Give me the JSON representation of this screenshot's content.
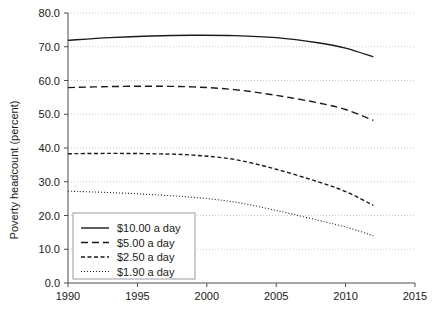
{
  "chart_data": {
    "type": "line",
    "title": "",
    "xlabel": "",
    "ylabel": "Poverty headcount (percent)",
    "xlim": [
      1990,
      2015
    ],
    "ylim": [
      0.0,
      80.0
    ],
    "grid": true,
    "legend_position": "lower-left",
    "x_ticks": [
      "1990",
      "1995",
      "2000",
      "2005",
      "2010",
      "2015"
    ],
    "y_ticks": [
      "0.0",
      "10.0",
      "20.0",
      "30.0",
      "40.0",
      "50.0",
      "60.0",
      "70.0",
      "80.0"
    ],
    "x": [
      1990,
      1993,
      1996,
      1999,
      2002,
      2005,
      2008,
      2010,
      2012
    ],
    "series": [
      {
        "name": "$10.00 a day",
        "style": "solid",
        "values": [
          71.9,
          72.7,
          73.2,
          73.4,
          73.3,
          72.7,
          71.2,
          69.6,
          67.0
        ]
      },
      {
        "name": "$5.00 a day",
        "style": "dashed-long",
        "values": [
          57.9,
          58.2,
          58.3,
          58.1,
          57.3,
          55.6,
          53.4,
          51.4,
          48.2
        ]
      },
      {
        "name": "$2.50 a day",
        "style": "dashed-short",
        "values": [
          38.3,
          38.4,
          38.3,
          37.9,
          36.6,
          33.7,
          30.0,
          27.1,
          23.0
        ]
      },
      {
        "name": "$1.90 a day",
        "style": "dotted",
        "values": [
          27.2,
          26.8,
          26.2,
          25.4,
          24.0,
          21.5,
          18.6,
          16.6,
          14.0
        ]
      }
    ]
  },
  "axes": {
    "y_axis_title": "Poverty headcount (percent)"
  },
  "legend": {
    "items": [
      {
        "label": "$10.00 a day",
        "style": "solid"
      },
      {
        "label": "$5.00 a day",
        "style": "dashed-long"
      },
      {
        "label": "$2.50 a day",
        "style": "dashed-short"
      },
      {
        "label": "$1.90 a day",
        "style": "dotted"
      }
    ]
  },
  "colors": {
    "ink": "#1a1a1a",
    "axis": "#4d4d4d",
    "grid": "#c9c9cf",
    "legend_border": "#9a9aa6",
    "background": "#ffffff"
  }
}
